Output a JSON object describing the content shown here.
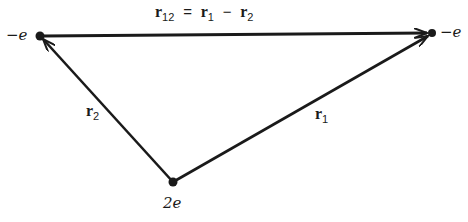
{
  "diagram": {
    "type": "vector-triangle",
    "nodes": [
      {
        "id": "left",
        "label": "−e",
        "x": 40,
        "y": 36
      },
      {
        "id": "right",
        "label": "−e",
        "x": 432,
        "y": 33
      },
      {
        "id": "bottom",
        "label": "2e",
        "x": 173,
        "y": 182
      }
    ],
    "edges": [
      {
        "from": "left",
        "to": "right",
        "label": "r12 = r1 − r2"
      },
      {
        "from": "bottom",
        "to": "left",
        "label": "r2"
      },
      {
        "from": "bottom",
        "to": "right",
        "label": "r1"
      }
    ]
  },
  "labels": {
    "left_charge": "−e",
    "right_charge": "−e",
    "bottom_charge": "2e",
    "top_vec": "r",
    "top_sub": "12",
    "equals": "=",
    "r1_vec": "r",
    "r1_sub": "1",
    "minus": "−",
    "r2_vec": "r",
    "r2_sub": "2",
    "edge_r1_vec": "r",
    "edge_r1_sub": "1",
    "edge_r2_vec": "r",
    "edge_r2_sub": "2"
  },
  "colors": {
    "line": "#1a1a1a",
    "background": "#ffffff"
  }
}
